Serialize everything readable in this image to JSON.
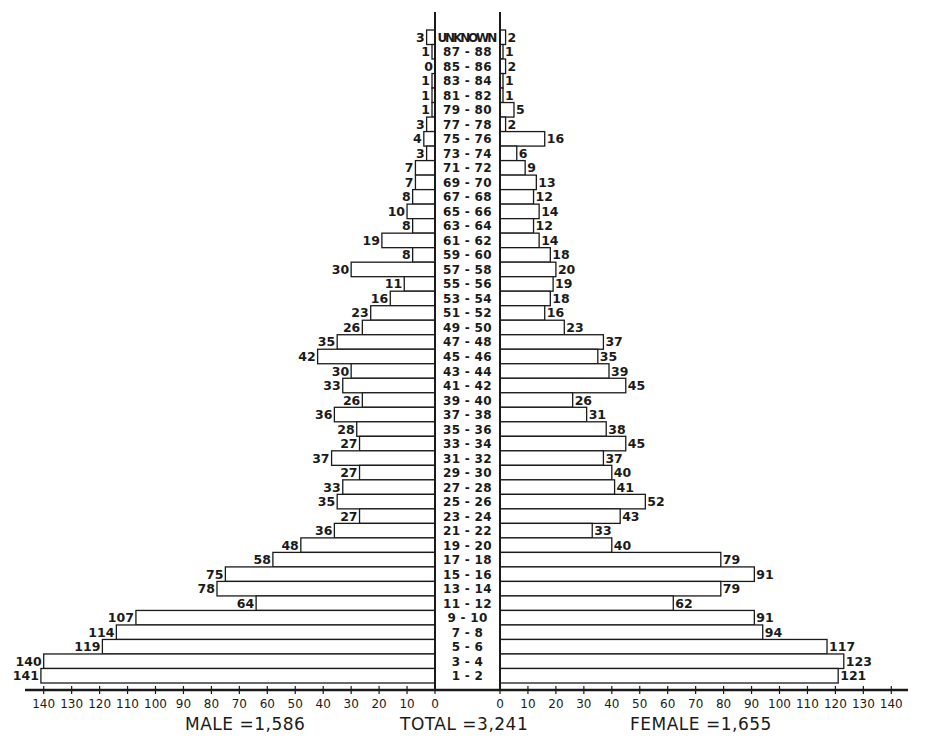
{
  "chart_data": {
    "type": "bar",
    "subtype": "population-pyramid",
    "title": "",
    "orientation": "horizontal",
    "categories": [
      "UNKNOWN",
      "87-88",
      "85-86",
      "83-84",
      "81-82",
      "79-80",
      "77-78",
      "75-76",
      "73-74",
      "71-72",
      "69-70",
      "67-68",
      "65-66",
      "63-64",
      "61-62",
      "59-60",
      "57-58",
      "55-56",
      "53-54",
      "51-52",
      "49-50",
      "47-48",
      "45-46",
      "43-44",
      "41-42",
      "39-40",
      "37-38",
      "35-36",
      "33-34",
      "31-32",
      "29-30",
      "27-28",
      "25-26",
      "23-24",
      "21-22",
      "19-20",
      "17-18",
      "15-16",
      "13-14",
      "11-12",
      "9-10",
      "7-8",
      "5-6",
      "3-4",
      "1-2"
    ],
    "series": [
      {
        "name": "MALE",
        "side": "left",
        "values": [
          3,
          1,
          0,
          1,
          1,
          1,
          3,
          4,
          3,
          7,
          7,
          8,
          10,
          8,
          19,
          8,
          30,
          11,
          16,
          23,
          26,
          35,
          42,
          30,
          33,
          26,
          36,
          28,
          27,
          37,
          27,
          33,
          35,
          27,
          36,
          48,
          58,
          75,
          78,
          64,
          107,
          114,
          119,
          140,
          141
        ]
      },
      {
        "name": "FEMALE",
        "side": "right",
        "values": [
          2,
          1,
          2,
          1,
          1,
          5,
          2,
          16,
          6,
          9,
          13,
          12,
          14,
          12,
          14,
          18,
          20,
          19,
          18,
          16,
          23,
          37,
          35,
          39,
          45,
          26,
          31,
          38,
          45,
          37,
          40,
          41,
          52,
          43,
          33,
          40,
          79,
          91,
          79,
          62,
          91,
          94,
          117,
          123,
          121
        ]
      }
    ],
    "xaxis_ticks": [
      140,
      130,
      120,
      110,
      100,
      90,
      80,
      70,
      60,
      50,
      40,
      30,
      20,
      10,
      0
    ],
    "xlim": [
      0,
      140
    ],
    "grid": false,
    "legend": null,
    "annotations": {
      "male_total": "MALE = 1,586",
      "total": "TOTAL = 3,241",
      "female_total": "FEMALE = 1,655"
    }
  },
  "labels": {
    "male_total": "MALE =1,586",
    "total": "TOTAL =3,241",
    "female_total": "FEMALE =1,655"
  }
}
